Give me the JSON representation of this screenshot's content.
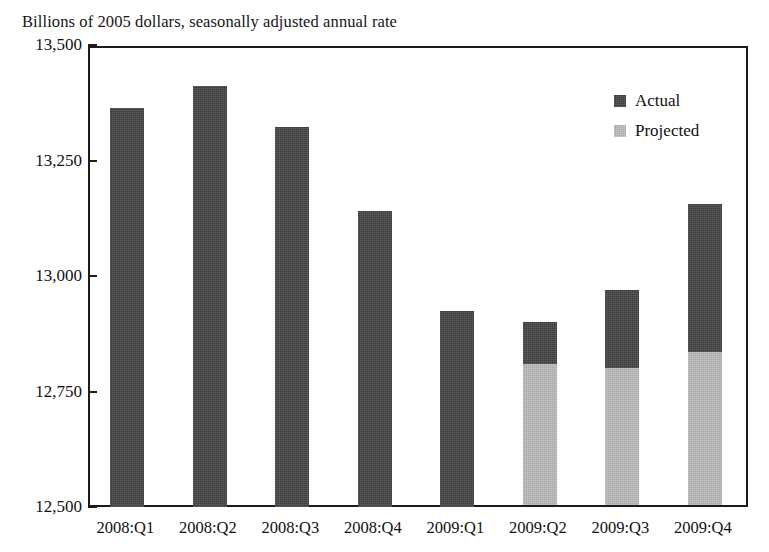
{
  "subtitle": "Billions of 2005 dollars, seasonally adjusted annual rate",
  "legend": {
    "items": [
      {
        "label": "Actual",
        "color": "#3d3d3d",
        "swatch_name": "legend-swatch-actual"
      },
      {
        "label": "Projected",
        "color": "#a9a9a9",
        "swatch_name": "legend-swatch-projected"
      }
    ]
  },
  "chart_data": {
    "type": "bar",
    "stacked": true,
    "title": "",
    "subtitle": "Billions of 2005 dollars, seasonally adjusted annual rate",
    "xlabel": "",
    "ylabel": "",
    "ylim": [
      12500,
      13500
    ],
    "ytick_labels": [
      "13,500",
      "13,250",
      "13,000",
      "12,750",
      "12,500"
    ],
    "ytick_values": [
      13500,
      13250,
      13000,
      12750,
      12500
    ],
    "grid": false,
    "legend_position": "top-right",
    "categories": [
      "2008:Q1",
      "2008:Q2",
      "2008:Q3",
      "2008:Q4",
      "2009:Q1",
      "2009:Q2",
      "2009:Q3",
      "2009:Q4"
    ],
    "series": [
      {
        "name": "Actual",
        "color": "#3d3d3d",
        "values": [
          13364,
          13412,
          13323,
          13141,
          12924,
          12900,
          12970,
          13156
        ]
      },
      {
        "name": "Projected",
        "color": "#a9a9a9",
        "values": [
          null,
          null,
          null,
          null,
          null,
          12810,
          12801,
          12835
        ]
      }
    ],
    "bars": [
      {
        "category": "2008:Q1",
        "total": 13364,
        "actual_top": 13364,
        "projected_top": null
      },
      {
        "category": "2008:Q2",
        "total": 13412,
        "actual_top": 13412,
        "projected_top": null
      },
      {
        "category": "2008:Q3",
        "total": 13323,
        "actual_top": 13323,
        "projected_top": null
      },
      {
        "category": "2008:Q4",
        "total": 13141,
        "actual_top": 13141,
        "projected_top": null
      },
      {
        "category": "2009:Q1",
        "total": 12924,
        "actual_top": 12924,
        "projected_top": null
      },
      {
        "category": "2009:Q2",
        "total": 12900,
        "actual_top": 12900,
        "projected_top": 12810
      },
      {
        "category": "2009:Q3",
        "total": 12970,
        "actual_top": 12970,
        "projected_top": 12801
      },
      {
        "category": "2009:Q4",
        "total": 13156,
        "actual_top": 13156,
        "projected_top": 12835
      }
    ]
  }
}
